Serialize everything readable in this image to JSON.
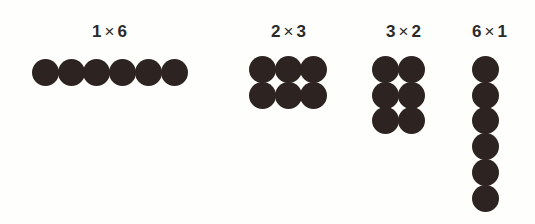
{
  "figure": {
    "dot_color": "#2d2321",
    "background": "#fefefc",
    "arrangements": [
      {
        "id": "1x6",
        "label_rows": "1",
        "label_times": "×",
        "label_cols": "6",
        "rows": 1,
        "cols": 6
      },
      {
        "id": "2x3",
        "label_rows": "2",
        "label_times": "×",
        "label_cols": "3",
        "rows": 2,
        "cols": 3
      },
      {
        "id": "3x2",
        "label_rows": "3",
        "label_times": "×",
        "label_cols": "2",
        "rows": 3,
        "cols": 2
      },
      {
        "id": "6x1",
        "label_rows": "6",
        "label_times": "×",
        "label_cols": "1",
        "rows": 6,
        "cols": 1
      }
    ]
  }
}
